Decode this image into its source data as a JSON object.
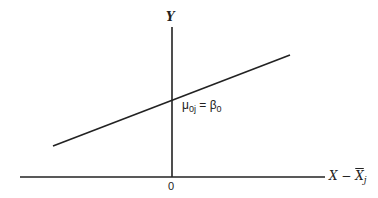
{
  "diagram": {
    "type": "linear regression line with intercept",
    "axes": {
      "y_label": "Y",
      "x_label_prefix": "X",
      "x_label_minus": " − ",
      "x_label_bar": "X",
      "x_label_sub": "j",
      "origin_label": "0"
    },
    "annotation": {
      "mu": "μ",
      "mu_sub": "0j",
      "equals": " = ",
      "beta": "β",
      "beta_sub": "0"
    },
    "colors": {
      "line": "#222222",
      "background": "#ffffff"
    }
  }
}
